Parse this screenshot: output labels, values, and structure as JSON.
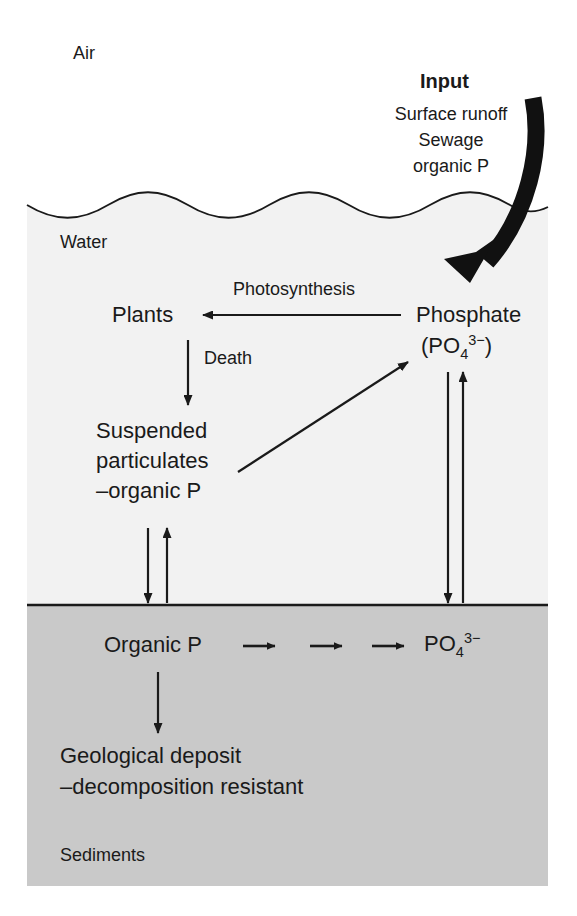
{
  "figure": {
    "colors": {
      "air": "#ffffff",
      "water": "#f2f2f2",
      "sediment": "#c9c9c9",
      "ink": "#1a1a1a",
      "arrow_fill": "#111111"
    }
  },
  "zones": [
    {
      "id": "air",
      "label": "Air"
    },
    {
      "id": "water",
      "label": "Water"
    },
    {
      "id": "sediments",
      "label": "Sediments"
    }
  ],
  "input": {
    "heading": "Input",
    "sources": [
      "Surface runoff",
      "Sewage",
      "organic P"
    ],
    "arrow_name": "input-arrow"
  },
  "nodes": {
    "plants": {
      "label": "Plants"
    },
    "phosphate": {
      "name": "Phosphate",
      "formula_prefix": "(PO",
      "formula_sub": "4",
      "formula_sup": "3−",
      "formula_suffix": ")"
    },
    "suspended": {
      "line1": "Suspended",
      "line2": "particulates",
      "line3": "–organic P"
    },
    "sediment_organic_p": {
      "label": "Organic P"
    },
    "sediment_phosphate": {
      "prefix": "PO",
      "sub": "4",
      "sup": "3−"
    },
    "geological": {
      "line1": "Geological deposit",
      "line2": "–decomposition resistant"
    }
  },
  "flows": [
    {
      "id": "photosynthesis",
      "label": "Photosynthesis",
      "from": "phosphate",
      "to": "plants",
      "direction": "left"
    },
    {
      "id": "death",
      "label": "Death",
      "from": "plants",
      "to": "suspended",
      "direction": "down"
    },
    {
      "id": "remineralization",
      "label": "",
      "from": "suspended",
      "to": "phosphate",
      "direction": "up-right"
    },
    {
      "id": "particulate-settling",
      "label": "",
      "from": "suspended",
      "to": "sediment_organic_p",
      "direction": "down"
    },
    {
      "id": "particulate-resuspension",
      "label": "",
      "from": "sediment_organic_p",
      "to": "suspended",
      "direction": "up"
    },
    {
      "id": "phosphate-settling",
      "label": "",
      "from": "phosphate",
      "to": "sediment_phosphate",
      "direction": "down"
    },
    {
      "id": "phosphate-release",
      "label": "",
      "from": "sediment_phosphate",
      "to": "phosphate",
      "direction": "up"
    },
    {
      "id": "mineralization-1",
      "label": "",
      "direction": "right"
    },
    {
      "id": "mineralization-2",
      "label": "",
      "direction": "right"
    },
    {
      "id": "mineralization-3",
      "label": "",
      "direction": "right"
    },
    {
      "id": "burial",
      "label": "",
      "from": "sediment_organic_p",
      "to": "geological",
      "direction": "down"
    }
  ]
}
